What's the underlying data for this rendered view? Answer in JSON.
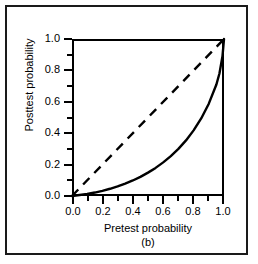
{
  "figure": {
    "panel_label": "(b)",
    "border_color": "#1a1a1a",
    "background": "#ffffff"
  },
  "chart_data": {
    "type": "line",
    "title": "",
    "subtitle": "(b)",
    "xlabel": "Pretest  probability",
    "ylabel": "Posttest probability",
    "xlim": [
      0.0,
      1.0
    ],
    "ylim": [
      0.0,
      1.0
    ],
    "grid": false,
    "legend": null,
    "xticks": [
      0.0,
      0.2,
      0.4,
      0.6,
      0.8,
      1.0
    ],
    "xtick_labels": [
      "0.0",
      "0.2",
      "0.4",
      "0.6",
      "0.8",
      "1.0"
    ],
    "xminor_ticks": [
      0.1,
      0.3,
      0.5,
      0.7,
      0.9
    ],
    "yticks": [
      0.0,
      0.2,
      0.4,
      0.6,
      0.8,
      1.0
    ],
    "ytick_labels": [
      "0.0",
      "0.2",
      "0.4",
      "0.6",
      "0.8",
      "1.0"
    ],
    "yminor_ticks": [
      0.1,
      0.3,
      0.5,
      0.7,
      0.9
    ],
    "series": [
      {
        "name": "posttest-probability-curve",
        "style": "solid",
        "color": "#000000",
        "width": 2,
        "x": [
          0.0,
          0.05,
          0.1,
          0.15,
          0.2,
          0.25,
          0.3,
          0.35,
          0.4,
          0.45,
          0.5,
          0.55,
          0.6,
          0.65,
          0.7,
          0.75,
          0.8,
          0.85,
          0.9,
          0.95,
          0.97,
          0.99,
          1.0
        ],
        "y": [
          0.0,
          0.006,
          0.013,
          0.022,
          0.033,
          0.046,
          0.061,
          0.079,
          0.099,
          0.122,
          0.149,
          0.179,
          0.214,
          0.254,
          0.3,
          0.354,
          0.418,
          0.494,
          0.588,
          0.71,
          0.78,
          0.89,
          1.0
        ]
      },
      {
        "name": "reference-diagonal",
        "style": "dashed",
        "color": "#000000",
        "width": 2,
        "x": [
          0.0,
          1.0
        ],
        "y": [
          0.0,
          1.0
        ]
      }
    ]
  }
}
